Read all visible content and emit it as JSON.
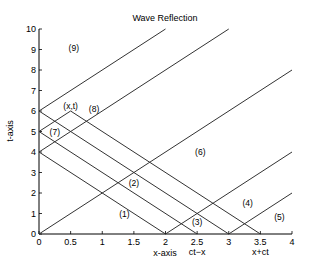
{
  "chart_data": {
    "type": "line",
    "title": "Wave Reflection",
    "xlabel": "x-axis",
    "ylabel": "t-axis",
    "xlim": [
      0,
      4
    ],
    "ylim": [
      0,
      10
    ],
    "grid": false,
    "xticks": [
      0,
      0.5,
      1,
      1.5,
      2,
      2.5,
      3,
      3.5,
      4
    ],
    "xtick_labels": [
      "0",
      "0.5",
      "1",
      "1.5",
      "2",
      "2.5",
      "3",
      "3.5",
      "4"
    ],
    "yticks": [
      0,
      1,
      2,
      3,
      4,
      5,
      6,
      7,
      8,
      9,
      10
    ],
    "ytick_labels": [
      "0",
      "1",
      "2",
      "3",
      "4",
      "5",
      "6",
      "7",
      "8",
      "9",
      "10"
    ],
    "secondary_xlabels": [
      {
        "x": 2.5,
        "text": "ct−x"
      },
      {
        "x": 3.5,
        "text": "x+ct"
      }
    ],
    "series": [
      {
        "name": "characteristic-1",
        "points": [
          [
            0,
            0
          ],
          [
            4,
            8
          ]
        ]
      },
      {
        "name": "characteristic-2",
        "points": [
          [
            2,
            0
          ],
          [
            4,
            4
          ]
        ]
      },
      {
        "name": "characteristic-3",
        "points": [
          [
            3,
            0
          ],
          [
            4,
            2
          ]
        ]
      },
      {
        "name": "characteristic-4",
        "points": [
          [
            0,
            4
          ],
          [
            3,
            10
          ]
        ]
      },
      {
        "name": "characteristic-5",
        "points": [
          [
            0,
            6
          ],
          [
            2,
            10
          ]
        ]
      },
      {
        "name": "characteristic-6",
        "points": [
          [
            0,
            5
          ],
          [
            0.5,
            6
          ]
        ]
      },
      {
        "name": "characteristic-7",
        "points": [
          [
            0,
            4
          ],
          [
            2,
            0
          ]
        ]
      },
      {
        "name": "characteristic-8",
        "points": [
          [
            0,
            5
          ],
          [
            2.5,
            0
          ]
        ]
      },
      {
        "name": "characteristic-9",
        "points": [
          [
            0,
            6
          ],
          [
            3,
            0
          ]
        ]
      },
      {
        "name": "characteristic-10",
        "points": [
          [
            0.5,
            6
          ],
          [
            3.5,
            0
          ]
        ]
      }
    ],
    "annotations": [
      {
        "text": "(1)",
        "x": 1.35,
        "y": 1.0
      },
      {
        "text": "(2)",
        "x": 1.5,
        "y": 2.5
      },
      {
        "text": "(3)",
        "x": 2.5,
        "y": 0.6
      },
      {
        "text": "(4)",
        "x": 3.3,
        "y": 1.5
      },
      {
        "text": "(5)",
        "x": 3.8,
        "y": 0.85
      },
      {
        "text": "(6)",
        "x": 2.55,
        "y": 4.0
      },
      {
        "text": "(7)",
        "x": 0.25,
        "y": 5.0
      },
      {
        "text": "(8)",
        "x": 0.87,
        "y": 6.1
      },
      {
        "text": "(9)",
        "x": 0.55,
        "y": 9.05
      },
      {
        "text": "(x,t)",
        "x": 0.5,
        "y": 6.25
      }
    ]
  }
}
